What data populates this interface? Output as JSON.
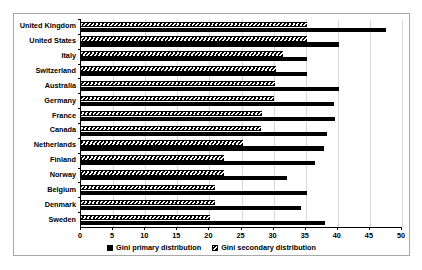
{
  "chart_data": {
    "type": "bar",
    "orientation": "horizontal",
    "title": "",
    "xlabel": "",
    "ylabel": "",
    "xlim": [
      0,
      50
    ],
    "xticks": [
      0,
      5,
      10,
      15,
      20,
      25,
      30,
      35,
      40,
      45,
      50
    ],
    "grid": true,
    "legend_position": "bottom",
    "categories": [
      "United Kingdom",
      "United States",
      "Italy",
      "Switzerland",
      "Australia",
      "Germany",
      "France",
      "Canada",
      "Netherlands",
      "Finland",
      "Norway",
      "Belgium",
      "Denmark",
      "Sweden"
    ],
    "series": [
      {
        "name": "Gini primary distribution",
        "style": "solid-black",
        "color": "#000000",
        "values": [
          47.5,
          40.2,
          35.2,
          35.2,
          40.2,
          39.4,
          39.6,
          38.3,
          37.8,
          36.4,
          32.1,
          35.2,
          34.3,
          38.0
        ]
      },
      {
        "name": "Gini secondary distribution",
        "style": "hatched",
        "color": "#000000",
        "values": [
          35.2,
          35.2,
          31.5,
          30.4,
          30.2,
          30.0,
          28.2,
          28.1,
          25.2,
          22.3,
          22.3,
          20.9,
          20.9,
          20.1
        ]
      }
    ]
  }
}
